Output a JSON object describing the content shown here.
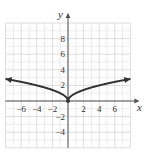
{
  "chart_data": {
    "type": "line",
    "title": "",
    "function": "y = sqrt(|x|)",
    "xlabel": "x",
    "ylabel": "y",
    "xlim": [
      -8,
      8
    ],
    "ylim": [
      -6,
      10
    ],
    "grid": true,
    "grid_step": 1,
    "x_ticks": [
      -6,
      -4,
      -2,
      2,
      4,
      6
    ],
    "y_ticks": [
      8,
      6,
      4,
      2,
      -2,
      -4
    ],
    "series": [
      {
        "name": "curve",
        "x": [
          -8,
          -6,
          -4,
          -2,
          -1,
          0,
          1,
          2,
          4,
          6,
          8
        ],
        "values": [
          2.83,
          2.45,
          2,
          1.41,
          1,
          0,
          1,
          1.41,
          2,
          2.45,
          2.83
        ],
        "arrows_both_ends": true
      }
    ],
    "marked_points": [
      {
        "x": 0,
        "y": 0
      }
    ]
  },
  "colors": {
    "grid": "#c8c8c8",
    "axis": "#555555",
    "curve": "#333333"
  }
}
